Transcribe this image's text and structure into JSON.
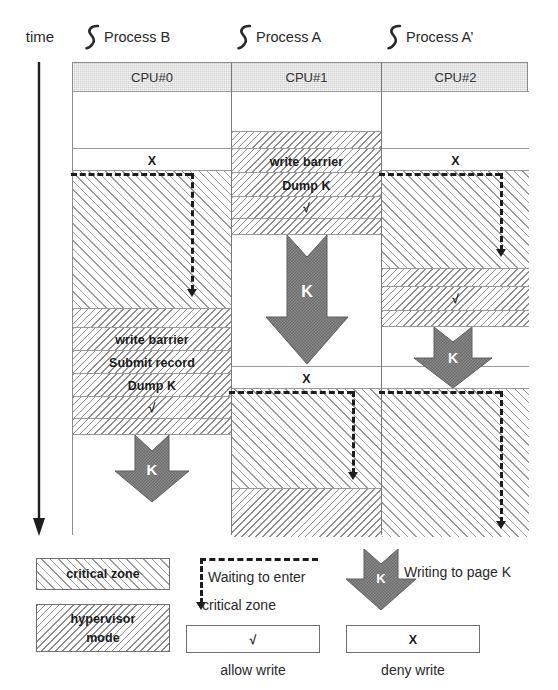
{
  "diagram": {
    "time_axis_label": "time",
    "processes": [
      {
        "icon": "process-squiggle-icon",
        "name": "Process B"
      },
      {
        "icon": "process-squiggle-icon",
        "name": "Process A"
      },
      {
        "icon": "process-squiggle-icon",
        "name": "Process A’"
      }
    ],
    "columns": [
      {
        "header": "CPU#0",
        "rows": [
          {
            "kind": "plain",
            "label": ""
          },
          {
            "kind": "plain",
            "label": "X"
          },
          {
            "kind": "critical",
            "label": ""
          },
          {
            "kind": "hypervisor",
            "label": ""
          },
          {
            "kind": "hypervisor",
            "label": "write barrier"
          },
          {
            "kind": "hypervisor",
            "label": "Submit record"
          },
          {
            "kind": "hypervisor",
            "label": "Dump K"
          },
          {
            "kind": "hypervisor",
            "label": "√"
          },
          {
            "kind": "hypervisor",
            "label": ""
          },
          {
            "kind": "plain",
            "label": ""
          }
        ]
      },
      {
        "header": "CPU#1",
        "rows": [
          {
            "kind": "plain",
            "label": ""
          },
          {
            "kind": "hypervisor",
            "label": ""
          },
          {
            "kind": "hypervisor",
            "label": "write barrier"
          },
          {
            "kind": "hypervisor",
            "label": "Dump K"
          },
          {
            "kind": "hypervisor",
            "label": "√"
          },
          {
            "kind": "hypervisor",
            "label": ""
          },
          {
            "kind": "plain",
            "label": ""
          },
          {
            "kind": "plain",
            "label": "X"
          },
          {
            "kind": "critical",
            "label": ""
          },
          {
            "kind": "hypervisor",
            "label": ""
          }
        ]
      },
      {
        "header": "CPU#2",
        "rows": [
          {
            "kind": "plain",
            "label": ""
          },
          {
            "kind": "plain",
            "label": "X"
          },
          {
            "kind": "critical",
            "label": ""
          },
          {
            "kind": "hypervisor",
            "label": ""
          },
          {
            "kind": "hypervisor",
            "label": "√"
          },
          {
            "kind": "hypervisor",
            "label": ""
          },
          {
            "kind": "plain",
            "label": ""
          },
          {
            "kind": "plain",
            "label": "X"
          },
          {
            "kind": "critical",
            "label": ""
          }
        ]
      }
    ],
    "write_arrow_glyph": "K",
    "write_arrows": [
      {
        "column": "CPU#0"
      },
      {
        "column": "CPU#1"
      },
      {
        "column": "CPU#2"
      }
    ]
  },
  "legend": {
    "critical_zone": "critical zone",
    "hypervisor_mode": "hypervisor\nmode",
    "hypervisor_mode_line1": "hypervisor",
    "hypervisor_mode_line2": "mode",
    "waiting_line1": "Waiting to enter",
    "waiting_line2": "critical zone",
    "writing_to_page": "Writing to page K",
    "allow_symbol": "√",
    "allow_caption": "allow write",
    "deny_symbol": "X",
    "deny_caption": "deny write"
  },
  "colors": {
    "ink": "#231f20",
    "grid_line": "#8d8d8d",
    "header_fill": "#cfcfcf",
    "arrow_fill": "#6a6a6a",
    "dash_ink": "#1d1d1d"
  }
}
